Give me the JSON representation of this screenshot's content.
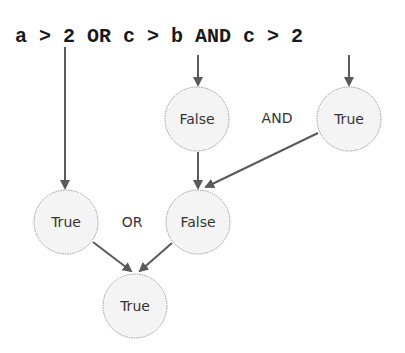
{
  "expression": {
    "tokens": [
      "a",
      ">",
      "2",
      "OR",
      "c",
      ">",
      "b",
      "AND",
      "c",
      ">",
      "2"
    ],
    "text": "a > 2 OR c > b AND c > 2"
  },
  "nodes": [
    {
      "id": "cmp_c_gt_b",
      "label": "False",
      "cx": 197,
      "cy": 119
    },
    {
      "id": "cmp_c_gt_2",
      "label": "True",
      "cx": 349,
      "cy": 119
    },
    {
      "id": "cmp_a_gt_2",
      "label": "True",
      "cx": 66,
      "cy": 222
    },
    {
      "id": "and_result",
      "label": "False",
      "cx": 198,
      "cy": 222
    },
    {
      "id": "or_result",
      "label": "True",
      "cx": 135,
      "cy": 306
    }
  ],
  "operators": [
    {
      "label": "AND",
      "x": 277,
      "y": 123
    },
    {
      "label": "OR",
      "x": 132,
      "y": 227
    }
  ],
  "colors": {
    "edge": "#5a5a5a",
    "node_fill": "#f4f4f4",
    "node_stroke": "#9a9a9a",
    "text": "#1a1a1a"
  }
}
